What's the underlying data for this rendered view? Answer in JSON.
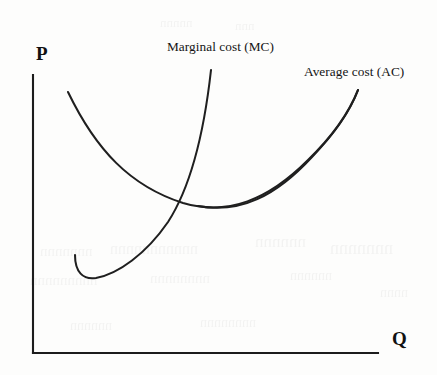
{
  "figure": {
    "kind": "economics-cost-curve-diagram",
    "background_color": "#fdfdfc",
    "ink_color": "#1f1f1f"
  },
  "axes": {
    "y_axis_label": "P",
    "x_axis_label": "Q",
    "y_axis_label_meaning": "Price",
    "x_axis_label_meaning": "Quantity",
    "origin_px": [
      33,
      353
    ],
    "y_axis_top_px": [
      33,
      75
    ],
    "x_axis_right_px": [
      378,
      353
    ],
    "ticks": [],
    "gridlines": false
  },
  "labels": {
    "marginal_cost": "Marginal cost (MC)",
    "average_cost": "Average cost (AC)"
  },
  "chart_data": {
    "type": "line",
    "title": "",
    "subtitle": "",
    "xlabel": "Q",
    "ylabel": "P",
    "xlim": [
      33,
      378
    ],
    "ylim": [
      353,
      75
    ],
    "grid": false,
    "legend_position": "inline-annotation",
    "annotations": [
      {
        "text": "Marginal cost (MC)",
        "x_px": 168,
        "y_px": 46,
        "points_to_series": "Marginal cost (MC)"
      },
      {
        "text": "Average cost (AC)",
        "x_px": 305,
        "y_px": 71,
        "points_to_series": "Average cost (AC)"
      }
    ],
    "intersection_px": [
      183,
      203
    ],
    "intersection_note": "MC crosses AC at the minimum region of the AC curve",
    "series": [
      {
        "name": "Average cost (AC)",
        "shape": "u-shaped",
        "path": "M 68 92 C 96 150, 130 186, 183 203 C 228 216, 268 200, 308 160 C 336 133, 350 110, 358 90",
        "path_break": "M 198 206 C 240 214, 276 196, 312 157 C 338 130, 351 109, 358 90",
        "points_px": [
          [
            68,
            92
          ],
          [
            86,
            128
          ],
          [
            107,
            159
          ],
          [
            134,
            182
          ],
          [
            160,
            196
          ],
          [
            183,
            203
          ],
          [
            210,
            208
          ],
          [
            236,
            207
          ],
          [
            262,
            198
          ],
          [
            288,
            180
          ],
          [
            312,
            153
          ],
          [
            336,
            120
          ],
          [
            358,
            90
          ]
        ]
      },
      {
        "name": "Marginal cost (MC)",
        "shape": "j-shaped-steeply-rising",
        "path": "M 75 255 C 75 272, 83 280, 96 278 C 118 274, 146 254, 168 222 C 190 188, 204 133, 211 70",
        "points_px": [
          [
            75,
            255
          ],
          [
            79,
            270
          ],
          [
            88,
            278
          ],
          [
            96,
            277
          ],
          [
            112,
            269
          ],
          [
            130,
            256
          ],
          [
            150,
            238
          ],
          [
            168,
            213
          ],
          [
            183,
            203
          ],
          [
            190,
            180
          ],
          [
            200,
            136
          ],
          [
            206,
            104
          ],
          [
            211,
            70
          ]
        ]
      }
    ]
  },
  "ghost_artifacts": {
    "description": "faint illegible bleed-through text from the reverse side of the scanned page",
    "marks": [
      {
        "text": "nnnnnnn",
        "x_px": 40,
        "y_px": 243,
        "size_px": 15
      },
      {
        "text": "nnnnnnnnnnn",
        "x_px": 110,
        "y_px": 240,
        "size_px": 16
      },
      {
        "text": "nnnnnn",
        "x_px": 255,
        "y_px": 232,
        "size_px": 17
      },
      {
        "text": "nnnnnnn",
        "x_px": 330,
        "y_px": 238,
        "size_px": 18
      },
      {
        "text": "nnnnnnnnn",
        "x_px": 30,
        "y_px": 272,
        "size_px": 15
      },
      {
        "text": "nnnnnnnn",
        "x_px": 150,
        "y_px": 270,
        "size_px": 15
      },
      {
        "text": "nnnnnn",
        "x_px": 290,
        "y_px": 268,
        "size_px": 14
      },
      {
        "text": "nnnn",
        "x_px": 380,
        "y_px": 285,
        "size_px": 14
      },
      {
        "text": "nnnnn",
        "x_px": 160,
        "y_px": 15,
        "size_px": 13
      },
      {
        "text": "nnn",
        "x_px": 235,
        "y_px": 18,
        "size_px": 13
      },
      {
        "text": "nnnnnn",
        "x_px": 70,
        "y_px": 318,
        "size_px": 14
      },
      {
        "text": "nnnnnnnn",
        "x_px": 200,
        "y_px": 315,
        "size_px": 14
      }
    ]
  }
}
